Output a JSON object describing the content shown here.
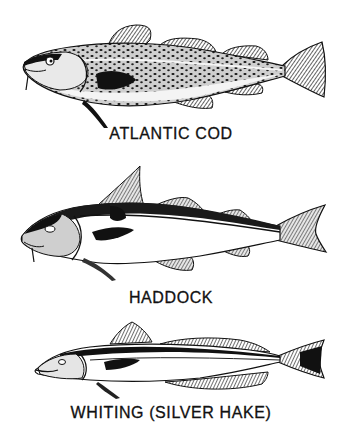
{
  "plate": {
    "background": "#ffffff",
    "ink": "#111111",
    "fish": [
      {
        "id": "atlantic-cod",
        "label": "ATLANTIC COD"
      },
      {
        "id": "haddock",
        "label": "HADDOCK"
      },
      {
        "id": "whiting",
        "label": "WHITING (SILVER HAKE)"
      }
    ]
  }
}
